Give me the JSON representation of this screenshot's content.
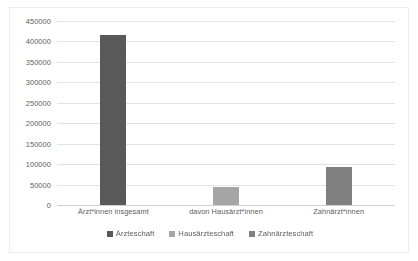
{
  "chart_data": {
    "type": "bar",
    "title": "",
    "xlabel": "",
    "ylabel": "",
    "ylim": [
      0,
      450000
    ],
    "ytick_step": 50000,
    "yticks": [
      "450000",
      "400000",
      "350000",
      "300000",
      "250000",
      "200000",
      "150000",
      "100000",
      "50000",
      "0"
    ],
    "ytick_values": [
      450000,
      400000,
      350000,
      300000,
      250000,
      200000,
      150000,
      100000,
      50000,
      0
    ],
    "grid": true,
    "legend_position": "bottom",
    "categories": [
      "Ärzt*innen insgesamt",
      "davon Hausärzt*innen",
      "Zahnärzt*innen"
    ],
    "series": [
      {
        "name": "Ärzteschaft",
        "color": "#595959",
        "values": [
          415000,
          null,
          null
        ]
      },
      {
        "name": "Hausärzteschaft",
        "color": "#a5a5a5",
        "values": [
          null,
          45000,
          null
        ]
      },
      {
        "name": "Zahnärzteschaft",
        "color": "#808080",
        "values": [
          null,
          null,
          92000
        ]
      }
    ],
    "bars": [
      {
        "category": "Ärzt*innen insgesamt",
        "series": "Ärzteschaft",
        "value": 415000,
        "color": "#595959"
      },
      {
        "category": "davon Hausärzt*innen",
        "series": "Hausärzteschaft",
        "value": 45000,
        "color": "#a5a5a5"
      },
      {
        "category": "Zahnärzt*innen",
        "series": "Zahnärzteschaft",
        "value": 92000,
        "color": "#808080"
      }
    ]
  },
  "legend": {
    "items": [
      {
        "label": "Ärzteschaft",
        "color": "#595959"
      },
      {
        "label": "Hausärzteschaft",
        "color": "#a5a5a5"
      },
      {
        "label": "Zahnärzteschaft",
        "color": "#808080"
      }
    ]
  },
  "colors": {
    "gridline": "#e3e3e3",
    "axis": "#cfcfcf",
    "tick_text": "#5d5d5d",
    "plot_background": "#ffffff",
    "frame_border": "#ededed"
  }
}
